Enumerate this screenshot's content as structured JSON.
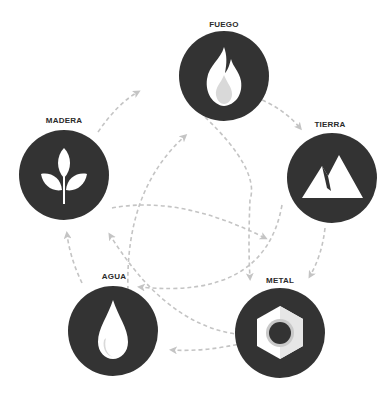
{
  "colors": {
    "node_fill": "#333333",
    "icon_fill": "#ffffff",
    "icon_shade": "#d9d9d9",
    "arrow": "#c4c4c4",
    "label": "#2b2b2b",
    "background": "#ffffff"
  },
  "elements": [
    {
      "id": "fuego",
      "label": "FUEGO",
      "icon": "fire-icon"
    },
    {
      "id": "tierra",
      "label": "TIERRA",
      "icon": "mountain-icon"
    },
    {
      "id": "metal",
      "label": "METAL",
      "icon": "hex-nut-icon"
    },
    {
      "id": "agua",
      "label": "AGUA",
      "icon": "water-drop-icon"
    },
    {
      "id": "madera",
      "label": "MADERA",
      "icon": "leaf-sprout-icon"
    }
  ],
  "cycles": {
    "generating": [
      "FUEGO",
      "TIERRA",
      "METAL",
      "AGUA",
      "MADERA",
      "FUEGO"
    ],
    "controlling": [
      "FUEGO",
      "METAL",
      "MADERA",
      "TIERRA",
      "AGUA",
      "FUEGO"
    ]
  }
}
